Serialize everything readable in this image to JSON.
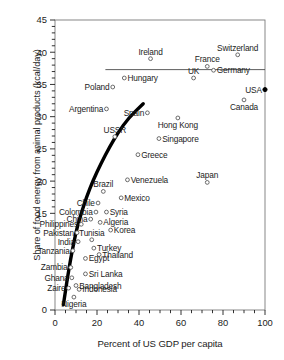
{
  "chart_data": {
    "type": "scatter",
    "title": "",
    "xlabel": "Percent of US GDP per capita",
    "ylabel": "Share of food energy from animal products (kcal/day)",
    "xlim": [
      0,
      100
    ],
    "ylim": [
      0,
      45
    ],
    "xticks": [
      0,
      20,
      40,
      60,
      80,
      100
    ],
    "yticks": [
      0,
      15,
      20,
      25,
      30,
      35,
      40,
      45
    ],
    "ytick_labels": [
      "0",
      "15",
      "20",
      "25",
      "30",
      "35",
      "40",
      "45"
    ],
    "grid": false,
    "legend": null,
    "minor_ticks": true,
    "reference_line": {
      "orientation": "horizontal",
      "y": 37.3,
      "x_start": 24,
      "x_end": 100
    },
    "trend_curve": {
      "style": "thick-black-curve",
      "points": [
        [
          4.0,
          0.8
        ],
        [
          5.0,
          3.0
        ],
        [
          6.2,
          5.5
        ],
        [
          7.5,
          8.0
        ],
        [
          9.0,
          10.5
        ],
        [
          10.5,
          12.8
        ],
        [
          12.5,
          15.0
        ],
        [
          15.0,
          17.5
        ],
        [
          18.0,
          20.0
        ],
        [
          22.0,
          22.8
        ],
        [
          26.0,
          25.3
        ],
        [
          30.0,
          27.5
        ],
        [
          35.0,
          29.8
        ],
        [
          42.0,
          32.0
        ]
      ]
    },
    "points": [
      {
        "label": "Switzerland",
        "x": 87.0,
        "y": 39.6,
        "label_pos": "above"
      },
      {
        "label": "Ireland",
        "x": 45.5,
        "y": 39.0,
        "label_pos": "above"
      },
      {
        "label": "France",
        "x": 72.5,
        "y": 37.8,
        "label_pos": "above"
      },
      {
        "label": "Germany",
        "x": 75.5,
        "y": 37.2,
        "label_pos": "right"
      },
      {
        "label": "UK",
        "x": 66.0,
        "y": 36.0,
        "label_pos": "above"
      },
      {
        "label": "Hungary",
        "x": 33.0,
        "y": 36.0,
        "label_pos": "right"
      },
      {
        "label": "Poland",
        "x": 27.5,
        "y": 34.6,
        "label_pos": "left"
      },
      {
        "label": "USA",
        "x": 100.0,
        "y": 34.2,
        "label_pos": "left",
        "filled": true
      },
      {
        "label": "Canada",
        "x": 90.0,
        "y": 32.6,
        "label_pos": "below"
      },
      {
        "label": "Argentina",
        "x": 24.5,
        "y": 31.2,
        "label_pos": "left"
      },
      {
        "label": "Spain",
        "x": 44.0,
        "y": 30.6,
        "label_pos": "left"
      },
      {
        "label": "Hong Kong",
        "x": 58.5,
        "y": 29.8,
        "label_pos": "below"
      },
      {
        "label": "USSR",
        "x": 28.5,
        "y": 26.9,
        "label_pos": "above"
      },
      {
        "label": "Singapore",
        "x": 49.5,
        "y": 26.6,
        "label_pos": "right"
      },
      {
        "label": "Greece",
        "x": 39.5,
        "y": 24.1,
        "label_pos": "right"
      },
      {
        "label": "Japan",
        "x": 72.5,
        "y": 19.8,
        "label_pos": "above"
      },
      {
        "label": "Venezuela",
        "x": 34.5,
        "y": 20.2,
        "label_pos": "right"
      },
      {
        "label": "Brazil",
        "x": 23.0,
        "y": 18.4,
        "label_pos": "above"
      },
      {
        "label": "Mexico",
        "x": 31.5,
        "y": 17.4,
        "label_pos": "right"
      },
      {
        "label": "Chile",
        "x": 20.5,
        "y": 16.6,
        "label_pos": "left"
      },
      {
        "label": "Colombia",
        "x": 19.5,
        "y": 15.2,
        "label_pos": "left"
      },
      {
        "label": "Syria",
        "x": 24.5,
        "y": 15.2,
        "label_pos": "right"
      },
      {
        "label": "China",
        "x": 17.0,
        "y": 14.1,
        "label_pos": "left"
      },
      {
        "label": "Algeria",
        "x": 21.5,
        "y": 13.6,
        "label_pos": "right"
      },
      {
        "label": "Philippines",
        "x": 12.5,
        "y": 13.3,
        "label_pos": "left"
      },
      {
        "label": "Korea",
        "x": 26.5,
        "y": 12.4,
        "label_pos": "right"
      },
      {
        "label": "Pakistan",
        "x": 10.5,
        "y": 12.0,
        "label_pos": "left"
      },
      {
        "label": "India",
        "x": 11.0,
        "y": 10.6,
        "label_pos": "left"
      },
      {
        "label": "Tunisia",
        "x": 17.5,
        "y": 10.9,
        "label_pos": "above"
      },
      {
        "label": "Turkey",
        "x": 18.5,
        "y": 9.6,
        "label_pos": "right"
      },
      {
        "label": "Tanzania",
        "x": 8.5,
        "y": 9.2,
        "label_pos": "left"
      },
      {
        "label": "Egypt",
        "x": 14.5,
        "y": 8.0,
        "label_pos": "right"
      },
      {
        "label": "Thailand",
        "x": 21.0,
        "y": 8.6,
        "label_pos": "right"
      },
      {
        "label": "Zambia",
        "x": 7.5,
        "y": 6.6,
        "label_pos": "left"
      },
      {
        "label": "Sri Lanka",
        "x": 14.5,
        "y": 5.6,
        "label_pos": "right"
      },
      {
        "label": "Ghana",
        "x": 8.0,
        "y": 5.0,
        "label_pos": "left"
      },
      {
        "label": "Bangladesh",
        "x": 10.0,
        "y": 3.8,
        "label_pos": "right"
      },
      {
        "label": "Zaire",
        "x": 6.5,
        "y": 3.4,
        "label_pos": "left"
      },
      {
        "label": "Indonesia",
        "x": 11.5,
        "y": 3.2,
        "label_pos": "right"
      },
      {
        "label": "Nigeria",
        "x": 9.0,
        "y": 2.0,
        "label_pos": "below"
      }
    ]
  }
}
